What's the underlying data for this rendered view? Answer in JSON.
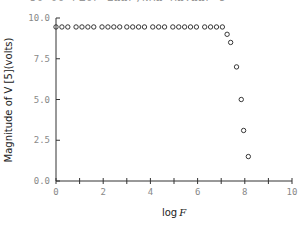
{
  "header_fragment": "30 06 ΓΔΟΓ ΣΩΩΓ,ΝΑΩ ΑΩ.ΩΩΓ 5",
  "chart_data": {
    "type": "scatter",
    "title": "",
    "xlabel": "log F",
    "ylabel": "Magnitude of V [5](volts)",
    "xlim": [
      0,
      10
    ],
    "ylim": [
      0,
      10
    ],
    "x_ticks": [
      "0",
      "2",
      "4",
      "6",
      "8",
      "10"
    ],
    "y_ticks": [
      "0.0",
      "2.5",
      "5.0",
      "7.5",
      "10.0"
    ],
    "grid": false,
    "marker": "open-circle",
    "x": [
      0.0,
      0.25,
      0.5,
      0.85,
      1.1,
      1.35,
      1.6,
      1.95,
      2.2,
      2.45,
      2.7,
      3.0,
      3.25,
      3.5,
      3.75,
      4.1,
      4.35,
      4.6,
      4.95,
      5.2,
      5.45,
      5.7,
      5.95,
      6.3,
      6.55,
      6.8,
      7.05,
      7.25,
      7.4,
      7.65,
      7.85,
      7.95,
      8.15
    ],
    "y": [
      9.45,
      9.45,
      9.45,
      9.45,
      9.45,
      9.45,
      9.45,
      9.45,
      9.45,
      9.45,
      9.45,
      9.45,
      9.45,
      9.45,
      9.45,
      9.45,
      9.45,
      9.45,
      9.45,
      9.45,
      9.45,
      9.45,
      9.45,
      9.45,
      9.45,
      9.45,
      9.45,
      9.0,
      8.5,
      7.0,
      5.0,
      3.1,
      1.5
    ]
  },
  "labels": {
    "xlabel_prefix": "log",
    "xlabel_var": "F",
    "ylabel_text": "Magnitude of V [5](volts)"
  }
}
